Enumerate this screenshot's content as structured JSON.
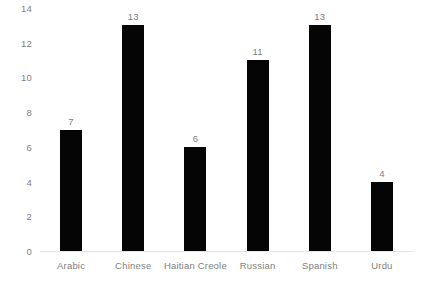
{
  "chart_data": {
    "type": "bar",
    "title": "",
    "subtitle": "",
    "xlabel": "",
    "ylabel": "",
    "categories": [
      "Arabic",
      "Chinese",
      "Haitian Creole",
      "Russian",
      "Spanish",
      "Urdu"
    ],
    "values": [
      7,
      13,
      6,
      11,
      13,
      4
    ],
    "value_labels": [
      "7",
      "13",
      "6",
      "11",
      "4"
    ],
    "ylim": [
      0,
      14
    ],
    "y_ticks": [
      0,
      2,
      4,
      6,
      8,
      10,
      12,
      14
    ],
    "y_tick_labels": [
      "0",
      "2",
      "4",
      "6",
      "8",
      "10",
      "12",
      "14"
    ],
    "grid": false,
    "legend": false,
    "legend_position": "none",
    "bar_color": "#050505",
    "label_color": "#808080",
    "baseline_color": "#e4e4e4",
    "background_color": "#ffffff"
  }
}
